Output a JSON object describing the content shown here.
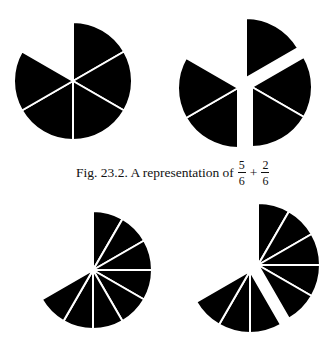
{
  "caption": {
    "prefix": "Fig. 23.2. A representation of",
    "fraction_a": {
      "numerator": "5",
      "denominator": "6"
    },
    "operator": "+",
    "fraction_b": {
      "numerator": "2",
      "denominator": "6"
    }
  },
  "colors": {
    "fill": "#000000",
    "separator": "#ffffff",
    "background": "#ffffff"
  },
  "figures": [
    {
      "id": "sixths-whole",
      "description": "Circle divided into sixths, five sectors shaded",
      "divisions": 6,
      "groups": [
        [
          0,
          1,
          2,
          3,
          4
        ]
      ]
    },
    {
      "id": "sixths-exploded",
      "description": "Five sixths separated into pieces of 1, 2 and 2 sectors",
      "divisions": 6,
      "groups": [
        [
          0
        ],
        [
          1,
          2
        ],
        [
          3,
          4
        ]
      ]
    },
    {
      "id": "twelfths-whole",
      "description": "Circle divided into twelfths, eight sectors shaded",
      "divisions": 12,
      "groups": [
        [
          0,
          1,
          2,
          3,
          4,
          5,
          6,
          7
        ]
      ]
    },
    {
      "id": "twelfths-exploded",
      "description": "Eight twelfths separated into pieces of 5 and 3 sectors",
      "divisions": 12,
      "groups": [
        [
          0,
          1,
          2,
          3,
          4
        ],
        [
          5,
          6,
          7
        ]
      ]
    }
  ]
}
